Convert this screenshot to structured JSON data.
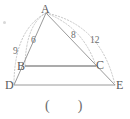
{
  "figure": {
    "kind": "geometry-diagram",
    "colors": {
      "solid_line": "#9a9a9a",
      "emphasis_line": "#8f8f8f",
      "dotted_arc": "#c9c9c9",
      "vertex_text": "#5a5a5a",
      "length_text": "#6e6e6e",
      "paren_text": "#6b6b6b",
      "background": "#ffffff"
    },
    "vertices": [
      {
        "id": "A",
        "label": "A",
        "x": 46,
        "y": 13
      },
      {
        "id": "B",
        "label": "B",
        "x": 25,
        "y": 66
      },
      {
        "id": "C",
        "label": "C",
        "x": 96,
        "y": 66
      },
      {
        "id": "D",
        "label": "D",
        "x": 14,
        "y": 85
      },
      {
        "id": "E",
        "label": "E",
        "x": 115,
        "y": 85
      }
    ],
    "segments": [
      {
        "id": "AD",
        "from": "A",
        "to": "D",
        "style": "solid"
      },
      {
        "id": "AE",
        "from": "A",
        "to": "E",
        "style": "solid"
      },
      {
        "id": "BC",
        "from": "B",
        "to": "C",
        "style": "solid-emphasis"
      },
      {
        "id": "DE",
        "from": "D",
        "to": "E",
        "style": "solid"
      }
    ],
    "measure_arcs": [
      {
        "id": "arc-AB",
        "from": "A",
        "to": "B",
        "side": "left",
        "inner": true,
        "label": "6"
      },
      {
        "id": "arc-AD",
        "from": "A",
        "to": "D",
        "side": "left",
        "inner": false,
        "label": "9"
      },
      {
        "id": "arc-AC",
        "from": "A",
        "to": "C",
        "side": "right",
        "inner": true,
        "label": "8"
      },
      {
        "id": "arc-AE",
        "from": "A",
        "to": "E",
        "side": "right",
        "inner": false,
        "label": "12"
      }
    ],
    "length_labels": [
      {
        "id": "len-6",
        "value": "6",
        "x": 31,
        "y": 36
      },
      {
        "id": "len-9",
        "value": "9",
        "x": 13,
        "y": 47
      },
      {
        "id": "len-8",
        "value": "8",
        "x": 71,
        "y": 31
      },
      {
        "id": "len-12",
        "value": "12",
        "x": 90,
        "y": 36
      }
    ],
    "answer_blank": {
      "id": "answer-blank",
      "open": "(",
      "close": ")",
      "text": "(        )",
      "x": 45,
      "y": 100
    }
  }
}
